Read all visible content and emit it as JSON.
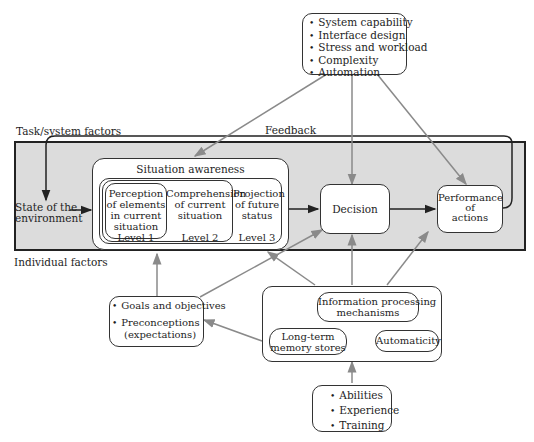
{
  "diagram": {
    "regions": {
      "task_system_label": "Task/system factors",
      "individual_label": "Individual factors",
      "feedback_label": "Feedback"
    },
    "task_factors": [
      "System capability",
      "Interface design",
      "Stress and workload",
      "Complexity",
      "Automation"
    ],
    "state_of_environment": [
      "State of the",
      "environment"
    ],
    "situation_awareness": {
      "title": "Situation awareness",
      "level1": {
        "text": [
          "Perception",
          "of elements",
          "in current",
          "situation"
        ],
        "level": "Level 1"
      },
      "level2": {
        "text": [
          "Comprehension",
          "of current",
          "situation"
        ],
        "level": "Level 2"
      },
      "level3": {
        "text": [
          "Projection",
          "of future",
          "status"
        ],
        "level": "Level 3"
      }
    },
    "decision": "Decision",
    "performance": [
      "Performance",
      "of",
      "actions"
    ],
    "goals": {
      "items": [
        "Goals and objectives",
        "Preconceptions"
      ],
      "sub": "(expectations)"
    },
    "info_processing": {
      "mechanisms": [
        "Information processing",
        "mechanisms"
      ],
      "ltm": [
        "Long-term",
        "memory stores"
      ],
      "automaticity": "Automaticity"
    },
    "individual_inputs": [
      "Abilities",
      "Experience",
      "Training"
    ],
    "colors": {
      "shaded_region": "#dcdcdc",
      "arrow_gray": "#8a8a8a",
      "line_dark": "#222222"
    }
  }
}
